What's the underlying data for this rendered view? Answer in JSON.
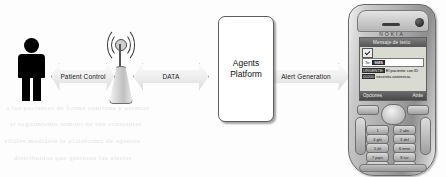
{
  "diagram": {
    "nodes": {
      "person": {
        "name": "patient",
        "label": ""
      },
      "antenna": {
        "name": "wireless access point",
        "label": ""
      },
      "platform": {
        "label_line1": "Agents",
        "label_line2": "Platform"
      },
      "phone": {
        "brand": "NOKIA"
      }
    },
    "arrows": [
      {
        "id": "patient-control",
        "label": "Patient Control",
        "direction": "bidirectional"
      },
      {
        "id": "data",
        "label": "DATA",
        "direction": "bidirectional"
      },
      {
        "id": "alert-generation",
        "label": "Alert Generation",
        "direction": "bidirectional"
      }
    ]
  },
  "phone_screen": {
    "title": "Mensaje de texto",
    "to_label": "To:",
    "to_value": "SMS",
    "message_prefix": "URGENTE:",
    "message_body": "El paciente con ID",
    "message_body2": "00200",
    "message_body3": "necesita asistencia.",
    "softkey_left": "Opciones",
    "softkey_right": "Atrás",
    "keys": [
      "1",
      "2 abc",
      "3 def",
      "4 ghi",
      "5 jkl",
      "6 mno",
      "7 pqrs",
      "8 tuv",
      "9 wxyz",
      "* +",
      "0 _",
      "# ¤"
    ]
  },
  "background_ghost_text": [
    "a los pacientes de forma continua y permite",
    "el seguimiento remoto de sus constantes",
    "vitales mediante la plataforma de agentes",
    "distribuidos que gestiona las alertas"
  ],
  "colors": {
    "person": "#000000",
    "box_border": "#5d5d5d",
    "arrow_fill": "#ededed",
    "background": "#ffffff"
  }
}
